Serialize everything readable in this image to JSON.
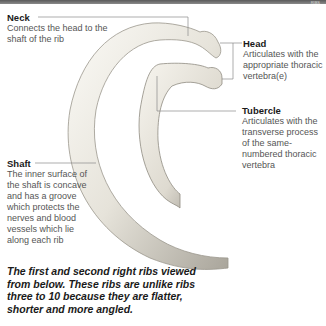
{
  "header": {
    "tag": "RIBS"
  },
  "labels": {
    "neck": {
      "title": "Neck",
      "desc": "Connects the head to the shaft of the rib"
    },
    "head": {
      "title": "Head",
      "desc": "Articulates with the appropriate thoracic vertebra(e)"
    },
    "tubercle": {
      "title": "Tubercle",
      "desc": "Articulates with the transverse process of the same-numbered thoracic vertebra"
    },
    "shaft": {
      "title": "Shaft",
      "desc": "The inner surface of the shaft is concave and has a groove which protects the nerves and blood vessels which lie along each rib"
    }
  },
  "caption": "The first and second right ribs viewed from below. These ribs are unlike ribs three to 10 because they are flatter, shorter and more angled.",
  "colors": {
    "bone_light": "#f2f0ea",
    "bone_shadow": "#9a968c",
    "leader": "#888888",
    "text": "#1a1a1a",
    "desc": "#555555"
  }
}
